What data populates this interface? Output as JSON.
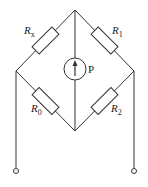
{
  "diagram": {
    "type": "wheatstone-bridge",
    "resistors": [
      {
        "id": "rx",
        "label": "R",
        "subscript": "x",
        "position": "top-left"
      },
      {
        "id": "r1",
        "label": "R",
        "subscript": "1",
        "position": "top-right"
      },
      {
        "id": "r0",
        "label": "R",
        "subscript": "0",
        "position": "bottom-left"
      },
      {
        "id": "r2",
        "label": "R",
        "subscript": "2",
        "position": "bottom-right"
      }
    ],
    "galvanometer": {
      "label": "P"
    },
    "terminals": [
      "left",
      "right"
    ],
    "colors": {
      "line": "#333333",
      "text": "#222222",
      "background": "#ffffff"
    }
  }
}
